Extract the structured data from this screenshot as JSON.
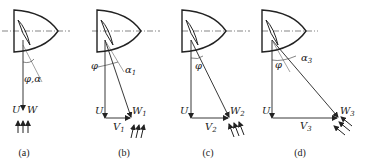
{
  "diagram": {
    "colors": {
      "ink": "#222222",
      "background": "#ffffff"
    },
    "panels": [
      {
        "id": "a",
        "caption": "(a)",
        "angle_label": "φ,α",
        "u_label": "U",
        "w_label": "W",
        "v_label": "",
        "v_sub": "",
        "w_sub": "",
        "alpha_label": "",
        "alpha_sub": ""
      },
      {
        "id": "b",
        "caption": "(b)",
        "phi_label": "φ",
        "alpha_label": "α",
        "alpha_sub": "1",
        "u_label": "U",
        "w_label": "W",
        "w_sub": "1",
        "v_label": "V",
        "v_sub": "1"
      },
      {
        "id": "c",
        "caption": "(c)",
        "phi_label": "φ",
        "u_label": "U",
        "w_label": "W",
        "w_sub": "2",
        "v_label": "V",
        "v_sub": "2"
      },
      {
        "id": "d",
        "caption": "(d)",
        "phi_label": "φ",
        "alpha_label": "α",
        "alpha_sub": "3",
        "u_label": "U",
        "w_label": "W",
        "w_sub": "3",
        "v_label": "V",
        "v_sub": "3"
      }
    ]
  }
}
